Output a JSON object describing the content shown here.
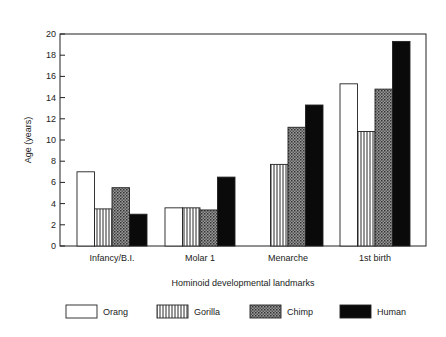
{
  "chart_data": {
    "type": "bar",
    "title": "",
    "xlabel": "Hominoid developmental landmarks",
    "ylabel": "Age (years)",
    "ylim": [
      0,
      20
    ],
    "yticks": [
      0,
      2,
      4,
      6,
      8,
      10,
      12,
      14,
      16,
      18,
      20
    ],
    "grid": false,
    "legend_position": "bottom",
    "categories": [
      "Infancy/B.I.",
      "Molar 1",
      "Menarche",
      "1st birth"
    ],
    "series": [
      {
        "name": "Orang",
        "pattern": "white",
        "values": [
          7,
          3.6,
          null,
          15.3
        ]
      },
      {
        "name": "Gorilla",
        "pattern": "vertical-stripes",
        "values": [
          3.5,
          3.6,
          7.7,
          10.8
        ]
      },
      {
        "name": "Chimp",
        "pattern": "crosshatch",
        "values": [
          5.5,
          3.4,
          11.2,
          14.8
        ]
      },
      {
        "name": "Human",
        "pattern": "black",
        "values": [
          3,
          6.5,
          13.3,
          19.3
        ]
      }
    ]
  }
}
